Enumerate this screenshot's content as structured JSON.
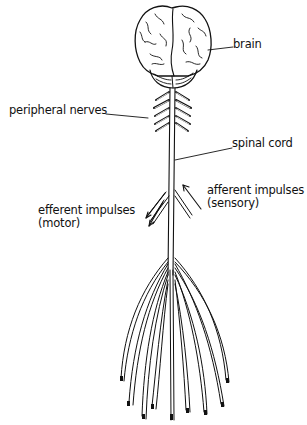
{
  "diagram": {
    "labels": {
      "brain": "brain",
      "peripheral_nerves": "peripheral nerves",
      "spinal_cord": "spinal cord",
      "afferent_line1": "afferent impulses",
      "afferent_line2": "(sensory)",
      "efferent_line1": "efferent impulses",
      "efferent_line2": "(motor)"
    },
    "colors": {
      "ink": "#111111",
      "background": "#ffffff"
    }
  }
}
